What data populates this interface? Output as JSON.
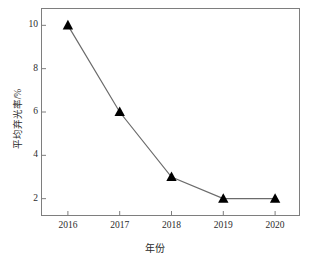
{
  "chart_data": {
    "type": "line",
    "title": "",
    "xlabel": "年份",
    "ylabel": "平均弃光率/%",
    "categories": [
      "2016",
      "2017",
      "2018",
      "2019",
      "2020"
    ],
    "values": [
      10,
      6,
      3,
      2,
      2
    ],
    "series": [
      {
        "name": "平均弃光率",
        "values": [
          10,
          6,
          3,
          2,
          2
        ],
        "marker": "filled-triangle",
        "marker_color": "#000000",
        "line_color": "#6b6b6b"
      }
    ],
    "points": [
      {
        "x": "2016",
        "y": 10
      },
      {
        "x": "2017",
        "y": 6
      },
      {
        "x": "2018",
        "y": 3
      },
      {
        "x": "2019",
        "y": 2
      },
      {
        "x": "2020",
        "y": 2
      }
    ],
    "xlim": [
      2015.5,
      2020.5
    ],
    "ylim": [
      1.2,
      10.8
    ],
    "yticks": [
      2,
      4,
      6,
      8,
      10
    ],
    "ytick_labels": [
      "2",
      "4",
      "6",
      "8",
      "10"
    ],
    "xticks": [
      "2016",
      "2017",
      "2018",
      "2019",
      "2020"
    ],
    "grid": false,
    "legend": null,
    "legend_position": "none",
    "frame": "box",
    "tick_direction": "in",
    "colors": {
      "axis": "#7e7e7e",
      "text": "#2b2b2b",
      "line": "#6b6b6b",
      "marker": "#000000",
      "background": "#ffffff"
    }
  }
}
